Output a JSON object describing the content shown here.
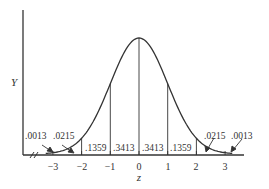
{
  "diagram": {
    "title": "",
    "y_axis_label": "Y",
    "x_axis_label": "z",
    "colors": {
      "line": "#333333",
      "background": "#ffffff"
    },
    "ticks": [
      "−3",
      "−2",
      "−1",
      "0",
      "1",
      "2",
      "3"
    ],
    "tick_values": [
      -3,
      -2,
      -1,
      0,
      1,
      2,
      3
    ],
    "area_labels": {
      "left_tail_far": ".0013",
      "left_tail_near": ".0215",
      "neg2_to_neg1": ".1359",
      "neg1_to_0": ".3413",
      "zero_to_1": ".3413",
      "one_to_2": ".1359",
      "right_tail_near": ".0215",
      "right_tail_far": ".0013"
    },
    "axis_break_symbol": "//"
  },
  "chart_data": {
    "type": "area",
    "xlabel": "z",
    "ylabel": "Y",
    "xlim": [
      -3.7,
      3.7
    ],
    "x_ticks": [
      -3,
      -2,
      -1,
      0,
      1,
      2,
      3
    ],
    "segments": [
      {
        "from": "-inf",
        "to": -3,
        "area": 0.0013
      },
      {
        "from": -3,
        "to": -2,
        "area": 0.0215
      },
      {
        "from": -2,
        "to": -1,
        "area": 0.1359
      },
      {
        "from": -1,
        "to": 0,
        "area": 0.3413
      },
      {
        "from": 0,
        "to": 1,
        "area": 0.3413
      },
      {
        "from": 1,
        "to": 2,
        "area": 0.1359
      },
      {
        "from": 2,
        "to": 3,
        "area": 0.0215
      },
      {
        "from": 3,
        "to": "inf",
        "area": 0.0013
      }
    ],
    "grid": false,
    "legend": null
  }
}
